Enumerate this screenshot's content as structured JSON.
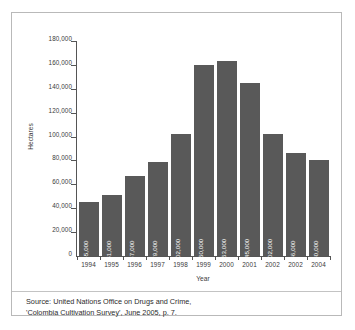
{
  "chart_data": {
    "type": "bar",
    "title": "",
    "xlabel": "Year",
    "ylabel": "Hectares",
    "categories": [
      "1994",
      "1995",
      "1996",
      "1997",
      "1998",
      "1999",
      "2000",
      "2001",
      "2002",
      "2002",
      "2004"
    ],
    "values": [
      45000,
      51000,
      67000,
      79000,
      102000,
      160000,
      163000,
      145000,
      102000,
      86000,
      80000
    ],
    "value_labels": [
      "45,000",
      "51,000",
      "67,000",
      "79,000",
      "102,000",
      "160,000",
      "163,000",
      "145,000",
      "102,000",
      "86,000",
      "80,000"
    ],
    "ylim": [
      0,
      180000
    ],
    "ytick_values": [
      0,
      20000,
      40000,
      60000,
      80000,
      100000,
      120000,
      140000,
      160000,
      180000
    ],
    "ytick_labels": [
      "0",
      "20,000",
      "40,000",
      "60,000",
      "80,000",
      "100,000",
      "120,000",
      "140,000",
      "160,000",
      "180,000"
    ],
    "grid": false,
    "legend": false,
    "bar_color": "#595959",
    "value_label_color": "#ffffff",
    "axis_color": "#555555"
  },
  "source": {
    "line1": "Source: United Nations Office on Drugs and Crime,",
    "line2": "'Colombia Cultivation Survey', June 2005, p. 7."
  },
  "frame": {
    "border_color": "#b9b9b9",
    "background": "#ffffff"
  }
}
